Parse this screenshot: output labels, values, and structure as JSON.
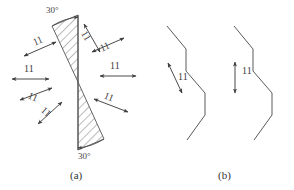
{
  "figure": {
    "title": "",
    "panels": [
      {
        "id": "a",
        "caption": "(a)",
        "caption_x": 70,
        "caption_y": 170
      },
      {
        "id": "b",
        "caption": "(b)",
        "caption_x": 218,
        "caption_y": 170
      }
    ]
  },
  "panel_a": {
    "angle_labels": [
      {
        "name": "angle-top",
        "text": "30°",
        "x": 46,
        "y": 6
      },
      {
        "name": "angle-bottom",
        "text": "30°",
        "x": 78,
        "y": 152
      }
    ],
    "hourglass": {
      "apex_x": 78,
      "apex_y": 82,
      "axis_top_y": 15,
      "axis_bottom_y": 150,
      "upper_wedge": "M78,15 L78,82 L52,26 Z",
      "lower_wedge": "M78,82 L78,150 L104,139 Z",
      "hatch_color": "#6b6b6b",
      "outline_color": "#555555"
    },
    "arrows": [
      {
        "name": "arrow-left-upper-outer",
        "label": "11",
        "x1": 24,
        "y1": 56,
        "x2": 56,
        "y2": 42,
        "lx": 33,
        "ly": 36,
        "rot": -24
      },
      {
        "name": "arrow-left-mid-upper",
        "label": "11",
        "x1": 12,
        "y1": 79,
        "x2": 49,
        "y2": 79,
        "lx": 24,
        "ly": 64,
        "rot": 0
      },
      {
        "name": "arrow-left-mid-lower",
        "label": "11",
        "x1": 20,
        "y1": 100,
        "x2": 52,
        "y2": 88,
        "lx": 28,
        "ly": 92,
        "rot": 22
      },
      {
        "name": "arrow-left-lower-outer",
        "label": "11",
        "x1": 38,
        "y1": 124,
        "x2": 62,
        "y2": 102,
        "lx": 41,
        "ly": 107,
        "rot": 42
      },
      {
        "name": "arrow-right-upper-outer",
        "label": "11",
        "x1": 84,
        "y1": 24,
        "x2": 100,
        "y2": 52,
        "lx": 81,
        "ly": 31,
        "rot": 60
      },
      {
        "name": "arrow-right-upper",
        "label": "11",
        "x1": 92,
        "y1": 52,
        "x2": 124,
        "y2": 38,
        "lx": 100,
        "ly": 42,
        "rot": -24
      },
      {
        "name": "arrow-right-mid",
        "label": "11",
        "x1": 100,
        "y1": 76,
        "x2": 136,
        "y2": 76,
        "lx": 110,
        "ly": 61,
        "rot": 0
      },
      {
        "name": "arrow-right-lower",
        "label": "11",
        "x1": 94,
        "y1": 99,
        "x2": 128,
        "y2": 112,
        "lx": 104,
        "ly": 92,
        "rot": 22
      }
    ]
  },
  "panel_b": {
    "staircases": [
      {
        "name": "staircase-left",
        "path": "M20,26 L39,49 L39,71 L58,93 L58,115 L40,140"
      },
      {
        "name": "staircase-right",
        "path": "M87,26 L106,49 L106,71 L125,93 L125,115 L107,140"
      }
    ],
    "dimensions": [
      {
        "name": "dimension-left",
        "label": "11",
        "x1": 168,
        "y1": 63,
        "x2": 182,
        "y2": 93,
        "lx": 178,
        "ly": 72
      },
      {
        "name": "dimension-right",
        "label": "11",
        "x1": 235,
        "y1": 62,
        "x2": 235,
        "y2": 93,
        "lx": 242,
        "ly": 66
      }
    ]
  },
  "style": {
    "ink": "#4a4a4a",
    "background": "#ffffff"
  }
}
